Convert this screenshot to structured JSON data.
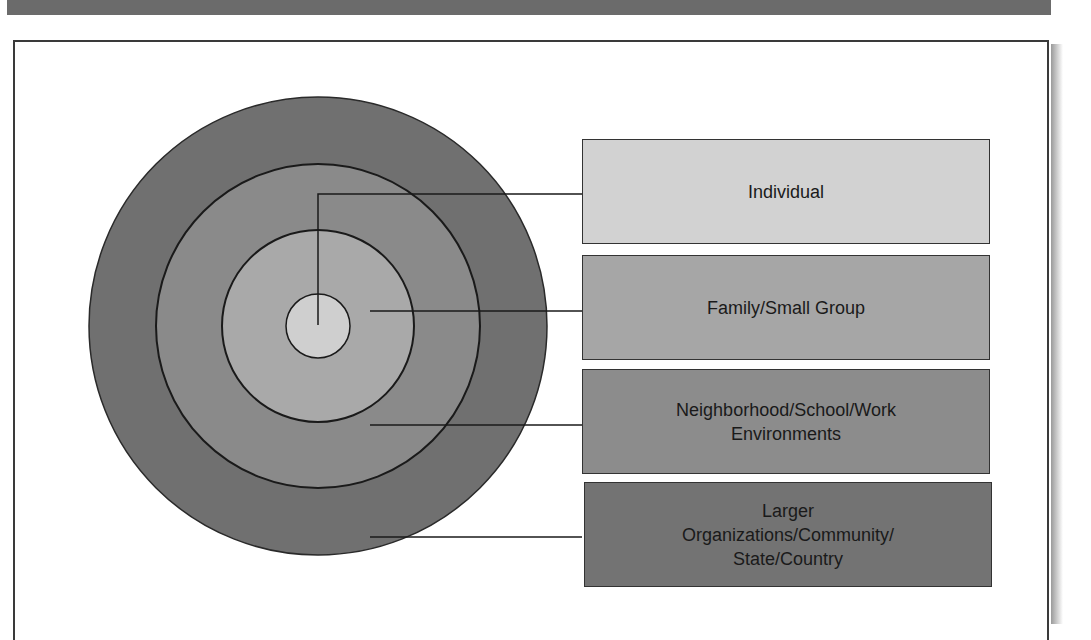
{
  "diagram": {
    "type": "concentric-circles",
    "levels": [
      {
        "id": "individual",
        "label": "Individual",
        "fill": "#cfcfcf",
        "box_fill": "#d2d2d2"
      },
      {
        "id": "family",
        "label": "Family/Small Group",
        "fill": "#a9a9a9",
        "box_fill": "#a6a6a6"
      },
      {
        "id": "neighborhood",
        "label": "Neighborhood/School/Work Environments",
        "fill": "#8a8a8a",
        "box_fill": "#8c8c8c"
      },
      {
        "id": "larger",
        "label": "Larger Organizations/Community/ State/Country",
        "fill": "#707070",
        "box_fill": "#737373"
      }
    ]
  },
  "colors": {
    "header_bar": "#6b6b6b",
    "outline": "#2a2a2a"
  }
}
